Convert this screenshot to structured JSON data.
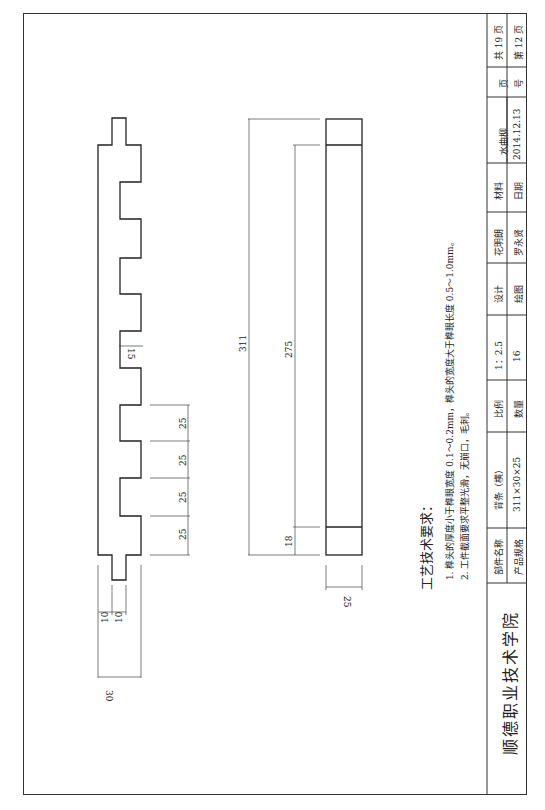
{
  "title_block": {
    "school": "顺德职业技术学院",
    "rows": [
      {
        "label_part_name": "部件名称",
        "part_name": "背条（横）",
        "label_scale": "比例",
        "scale": "1：2.5",
        "label_design": "设计",
        "designer": "花明朗",
        "label_material": "材料",
        "material": "水曲柳",
        "label_page": "页",
        "page_total": "共 19 页"
      },
      {
        "label_spec": "产品规格",
        "spec": "311×30×25",
        "label_quantity": "数量",
        "quantity": "16",
        "label_drawn": "绘图",
        "drawer": "罗永贤",
        "label_date": "日期",
        "date": "2014.12.13",
        "label_number": "号",
        "page_current": "第 12 页"
      }
    ]
  },
  "requirements": {
    "heading": "工艺技术要求：",
    "items": [
      "1. 榫头的厚度小于榫眼宽度 0.1～0.2mm，榫头的宽度大于榫眼长度 0.5～1.0mm。",
      "2. 工件截面要求平整光滑，无崩口，毛刺。"
    ]
  },
  "dimensions": {
    "profile": {
      "tenon_width_a": "10",
      "tenon_width_b": "10",
      "overall_width": "30",
      "slot_spacing": [
        "25",
        "25",
        "25",
        "25"
      ],
      "slot_depth": "15"
    },
    "bar": {
      "overall_length": "311",
      "inner_length": "275",
      "end_length": "18",
      "thickness": "25"
    }
  }
}
